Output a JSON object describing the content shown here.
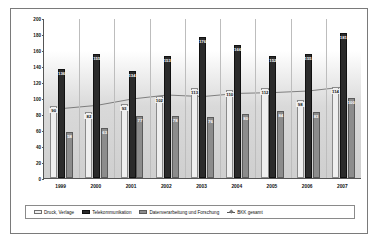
{
  "chart_data": {
    "type": "bar",
    "title": "",
    "xlabel": "",
    "ylabel": "",
    "ylim": [
      0,
      200
    ],
    "yticks": [
      0,
      20,
      40,
      60,
      80,
      100,
      120,
      140,
      160,
      180,
      200
    ],
    "grid": "vertical",
    "legend_position": "bottom",
    "categories": [
      "1999",
      "2000",
      "2001",
      "2002",
      "2003",
      "2004",
      "2005",
      "2006",
      "2007"
    ],
    "series": [
      {
        "name": "Druck, Verlage",
        "type": "bar",
        "color": "#efefef",
        "values": [
          90,
          82,
          93,
          102,
          113,
          110,
          112,
          98,
          114
        ]
      },
      {
        "name": "Telekommunikation",
        "type": "bar",
        "color": "#2b2b2b",
        "values": [
          136,
          155,
          134,
          153,
          176,
          166,
          152,
          155,
          181
        ]
      },
      {
        "name": "Datenverarbeitung und Forschung",
        "type": "bar",
        "color": "#8c8c8c",
        "values": [
          58,
          63,
          77,
          78,
          76,
          80,
          84,
          83,
          100
        ]
      },
      {
        "name": "BKK gesamt",
        "type": "line",
        "color": "#555555",
        "values": [
          88,
          92,
          100,
          105,
          103,
          107,
          108,
          110,
          115
        ]
      }
    ]
  },
  "legend": {
    "items": [
      {
        "label": "Druck, Verlage",
        "swatch": "light"
      },
      {
        "label": "Telekommunikation",
        "swatch": "dark"
      },
      {
        "label": "Datenverarbeitung und Forschung",
        "swatch": "mid"
      },
      {
        "label": "BKK gesamt",
        "swatch": "line"
      }
    ]
  },
  "axis": {
    "y_labels": [
      "200",
      "180",
      "160",
      "140",
      "120",
      "100",
      "80",
      "60",
      "40",
      "20",
      "0"
    ]
  }
}
